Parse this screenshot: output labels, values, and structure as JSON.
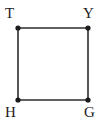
{
  "figure": {
    "type": "undirected-graph",
    "background_color": "#ffffff",
    "edge_color": "#2b2b2b",
    "vertex_color": "#1a1a1a",
    "label_color": "#1a1a1a",
    "edge_width": 1.6,
    "vertex_radius": 2.6
  },
  "graph_data": {
    "vertices": [
      {
        "id": "T",
        "label": "T",
        "x": 18,
        "y": 28,
        "label_position": "above-left"
      },
      {
        "id": "Y",
        "label": "Y",
        "x": 88,
        "y": 28,
        "label_position": "above-right"
      },
      {
        "id": "H",
        "label": "H",
        "x": 18,
        "y": 100,
        "label_position": "below-left"
      },
      {
        "id": "G",
        "label": "G",
        "x": 88,
        "y": 100,
        "label_position": "below-right"
      }
    ],
    "edges": [
      {
        "from": "T",
        "to": "Y"
      },
      {
        "from": "Y",
        "to": "G"
      },
      {
        "from": "G",
        "to": "H"
      },
      {
        "from": "H",
        "to": "T"
      }
    ],
    "shape": "square",
    "vertex_count": 4,
    "edge_count": 4
  },
  "labels": {
    "top_left": "T",
    "top_right": "Y",
    "bottom_left": "H",
    "bottom_right": "G"
  }
}
